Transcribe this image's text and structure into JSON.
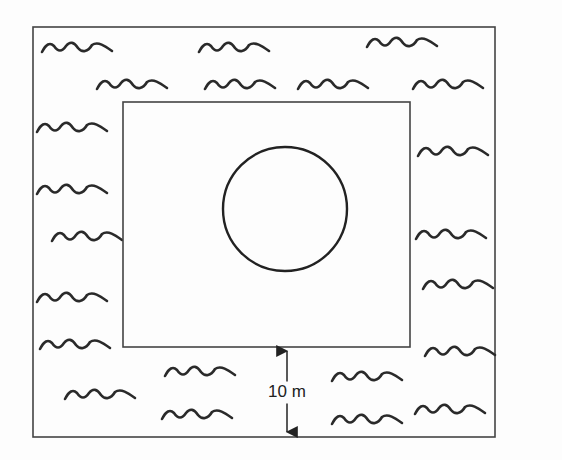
{
  "diagram": {
    "outer_rect": {
      "x": 33,
      "y": 27,
      "w": 462,
      "h": 410
    },
    "inner_rect": {
      "x": 123,
      "y": 102,
      "w": 287,
      "h": 245
    },
    "circle": {
      "cx": 285,
      "cy": 209,
      "r": 62
    },
    "dimension": {
      "label": "10 m",
      "x": 287,
      "y1": 349,
      "y2": 434
    },
    "waves": [
      [
        42,
        48
      ],
      [
        199,
        48
      ],
      [
        367,
        43
      ],
      [
        97,
        85
      ],
      [
        205,
        85
      ],
      [
        298,
        85
      ],
      [
        413,
        85
      ],
      [
        37,
        128
      ],
      [
        37,
        190
      ],
      [
        52,
        237
      ],
      [
        37,
        298
      ],
      [
        40,
        345
      ],
      [
        65,
        395
      ],
      [
        418,
        152
      ],
      [
        416,
        235
      ],
      [
        423,
        285
      ],
      [
        425,
        352
      ],
      [
        415,
        410
      ],
      [
        165,
        372
      ],
      [
        162,
        415
      ],
      [
        332,
        377
      ],
      [
        332,
        420
      ]
    ],
    "stroke_color": "#2a2a2a"
  }
}
